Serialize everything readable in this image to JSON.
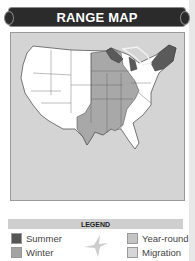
{
  "header": {
    "title": "RANGE MAP"
  },
  "map": {
    "region": "Contiguous United States",
    "colors": {
      "background": "#d4d4d4",
      "out_of_range": "#ffffff",
      "summer": "#5a5a5a",
      "winter": "#a8a8a8",
      "year_round": "#c8c8c8",
      "migration": "#d8d8d8"
    }
  },
  "legend": {
    "title": "LEGEND",
    "items": [
      {
        "label": "Summer",
        "color": "#555555"
      },
      {
        "label": "Winter",
        "color": "#a3a3a3"
      },
      {
        "label": "Year-round",
        "color": "#c4c4c4"
      },
      {
        "label": "Migration",
        "color": "#d6d6d6"
      }
    ],
    "icon": "bird-silhouette-icon"
  }
}
